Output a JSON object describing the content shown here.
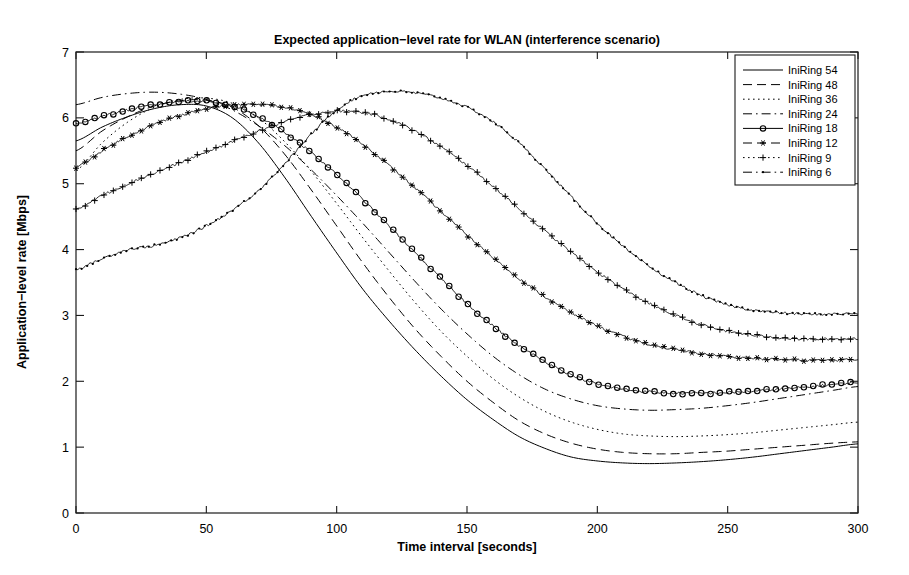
{
  "chart_data": {
    "type": "line",
    "title": "Expected application−level rate for WLAN (interference scenario)",
    "xlabel": "Time interval [seconds]",
    "ylabel": "Application−level rate [Mbps]",
    "xlim": [
      0,
      300
    ],
    "ylim": [
      0,
      7
    ],
    "xticks": [
      0,
      50,
      100,
      150,
      200,
      250,
      300
    ],
    "yticks": [
      0,
      1,
      2,
      3,
      4,
      5,
      6,
      7
    ],
    "grid": false,
    "legend_position": "top-right",
    "x": [
      0,
      10,
      20,
      30,
      40,
      50,
      60,
      70,
      80,
      90,
      100,
      110,
      120,
      130,
      140,
      150,
      160,
      170,
      180,
      190,
      200,
      210,
      220,
      230,
      240,
      250,
      260,
      270,
      280,
      290,
      300
    ],
    "series": [
      {
        "name": "IniRing 54",
        "style": "solid",
        "marker": "none",
        "values": [
          5.65,
          5.86,
          6.02,
          6.14,
          6.2,
          6.18,
          6.0,
          5.62,
          5.1,
          4.52,
          3.95,
          3.4,
          2.92,
          2.48,
          2.08,
          1.72,
          1.42,
          1.16,
          0.98,
          0.85,
          0.79,
          0.76,
          0.75,
          0.76,
          0.78,
          0.81,
          0.85,
          0.9,
          0.95,
          1.0,
          1.05
        ]
      },
      {
        "name": "IniRing 48",
        "style": "dashed",
        "marker": "none",
        "values": [
          5.5,
          5.8,
          6.02,
          6.18,
          6.26,
          6.27,
          6.16,
          5.88,
          5.45,
          4.92,
          4.36,
          3.8,
          3.28,
          2.8,
          2.38,
          2.0,
          1.68,
          1.4,
          1.2,
          1.06,
          0.97,
          0.92,
          0.9,
          0.9,
          0.92,
          0.94,
          0.97,
          1.0,
          1.03,
          1.06,
          1.08
        ]
      },
      {
        "name": "IniRing 36",
        "style": "dotted",
        "marker": "none",
        "values": [
          5.2,
          5.62,
          5.94,
          6.16,
          6.28,
          6.3,
          6.22,
          6.0,
          5.64,
          5.2,
          4.7,
          4.18,
          3.68,
          3.2,
          2.76,
          2.38,
          2.04,
          1.76,
          1.54,
          1.38,
          1.27,
          1.2,
          1.17,
          1.16,
          1.17,
          1.19,
          1.22,
          1.26,
          1.3,
          1.34,
          1.38
        ]
      },
      {
        "name": "IniRing 24",
        "style": "dashdot",
        "marker": "none",
        "values": [
          6.2,
          6.31,
          6.37,
          6.39,
          6.36,
          6.28,
          6.12,
          5.88,
          5.58,
          5.22,
          4.82,
          4.4,
          3.96,
          3.52,
          3.1,
          2.72,
          2.38,
          2.1,
          1.88,
          1.73,
          1.63,
          1.58,
          1.56,
          1.57,
          1.59,
          1.63,
          1.68,
          1.74,
          1.8,
          1.86,
          1.92
        ]
      },
      {
        "name": "IniRing 18",
        "style": "solid",
        "marker": "circle",
        "values": [
          5.92,
          6.02,
          6.12,
          6.2,
          6.25,
          6.25,
          6.18,
          6.02,
          5.78,
          5.48,
          5.14,
          4.76,
          4.36,
          3.96,
          3.56,
          3.18,
          2.84,
          2.54,
          2.3,
          2.1,
          1.96,
          1.88,
          1.84,
          1.82,
          1.82,
          1.83,
          1.85,
          1.88,
          1.91,
          1.95,
          1.98
        ]
      },
      {
        "name": "IniRing 12",
        "style": "dashed",
        "marker": "asterisk",
        "values": [
          5.25,
          5.5,
          5.72,
          5.9,
          6.04,
          6.14,
          6.19,
          6.2,
          6.16,
          6.05,
          5.86,
          5.6,
          5.28,
          4.94,
          4.58,
          4.22,
          3.88,
          3.56,
          3.28,
          3.04,
          2.84,
          2.68,
          2.56,
          2.48,
          2.42,
          2.38,
          2.35,
          2.33,
          2.32,
          2.32,
          2.33
        ]
      },
      {
        "name": "IniRing 9",
        "style": "dotted",
        "marker": "plus",
        "values": [
          4.62,
          4.82,
          5.0,
          5.16,
          5.32,
          5.48,
          5.64,
          5.8,
          5.94,
          6.05,
          6.1,
          6.08,
          5.98,
          5.8,
          5.56,
          5.28,
          4.96,
          4.62,
          4.28,
          3.96,
          3.66,
          3.4,
          3.18,
          3.0,
          2.86,
          2.76,
          2.7,
          2.66,
          2.64,
          2.64,
          2.65
        ]
      },
      {
        "name": "IniRing 6",
        "style": "dashdot",
        "marker": "dot",
        "values": [
          3.7,
          3.86,
          4.0,
          4.06,
          4.18,
          4.36,
          4.6,
          4.9,
          5.3,
          5.74,
          6.12,
          6.34,
          6.4,
          6.38,
          6.3,
          6.16,
          5.94,
          5.62,
          5.22,
          4.8,
          4.4,
          4.04,
          3.74,
          3.5,
          3.3,
          3.16,
          3.08,
          3.04,
          3.02,
          3.02,
          3.03
        ]
      }
    ]
  },
  "legend": {
    "items": [
      {
        "label": "IniRing 54"
      },
      {
        "label": "IniRing 48"
      },
      {
        "label": "IniRing 36"
      },
      {
        "label": "IniRing 24"
      },
      {
        "label": "IniRing 18"
      },
      {
        "label": "IniRing 12"
      },
      {
        "label": "IniRing 9"
      },
      {
        "label": "IniRing 6"
      }
    ]
  },
  "axes": {
    "x_tick_labels": [
      "0",
      "50",
      "100",
      "150",
      "200",
      "250",
      "300"
    ],
    "y_tick_labels": [
      "0",
      "1",
      "2",
      "3",
      "4",
      "5",
      "6",
      "7"
    ]
  },
  "colors": {
    "line": "#000000",
    "frame": "#1a1a1a",
    "background": "#ffffff"
  }
}
